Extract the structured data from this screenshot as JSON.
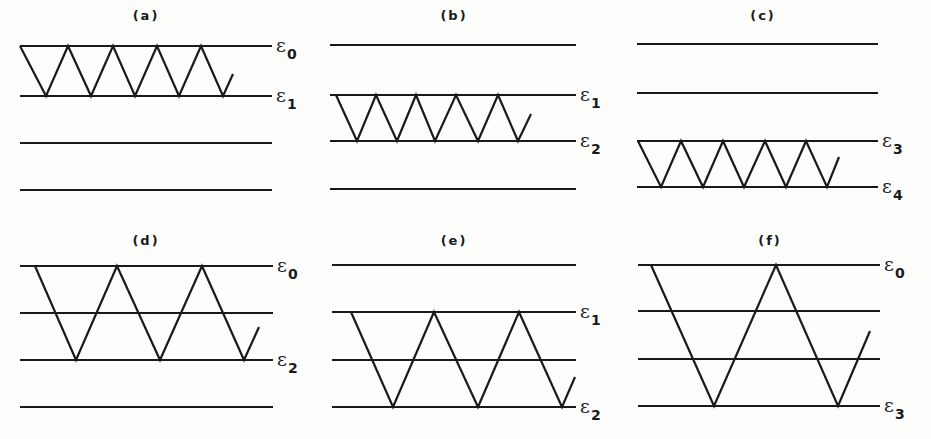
{
  "figure": {
    "stroke_color": "#1a1a1a",
    "background_color": "#fdfdfb",
    "epsilon_symbol": "ε",
    "panels": [
      {
        "id": "a",
        "label": "(a)",
        "label_pos": [
          146,
          16
        ],
        "levels_y": [
          46,
          96,
          143,
          190
        ],
        "levels_x": [
          20,
          272
        ],
        "level_labels": [
          {
            "sub": "0",
            "x": 276,
            "y": 52
          },
          {
            "sub": "1",
            "x": 276,
            "y": 102
          }
        ],
        "zigzag": [
          [
            20,
            46
          ],
          [
            46,
            96
          ],
          [
            68,
            46
          ],
          [
            91,
            96
          ],
          [
            113,
            46
          ],
          [
            135,
            96
          ],
          [
            157,
            46
          ],
          [
            179,
            96
          ],
          [
            201,
            46
          ],
          [
            223,
            96
          ],
          [
            233,
            74
          ]
        ]
      },
      {
        "id": "b",
        "label": "(b)",
        "label_pos": [
          454,
          16
        ],
        "levels_y": [
          45,
          95,
          141,
          189
        ],
        "levels_x": [
          330,
          576
        ],
        "level_labels": [
          {
            "sub": "1",
            "x": 580,
            "y": 101
          },
          {
            "sub": "2",
            "x": 580,
            "y": 147
          }
        ],
        "zigzag": [
          [
            336,
            95
          ],
          [
            357,
            141
          ],
          [
            376,
            95
          ],
          [
            397,
            141
          ],
          [
            416,
            95
          ],
          [
            435,
            141
          ],
          [
            456,
            95
          ],
          [
            478,
            141
          ],
          [
            498,
            95
          ],
          [
            518,
            141
          ],
          [
            531,
            114
          ]
        ]
      },
      {
        "id": "c",
        "label": "(c)",
        "label_pos": [
          763,
          16
        ],
        "levels_y": [
          44,
          93,
          141,
          187
        ],
        "levels_x": [
          637,
          878
        ],
        "level_labels": [
          {
            "sub": "3",
            "x": 882,
            "y": 147
          },
          {
            "sub": "4",
            "x": 882,
            "y": 193
          }
        ],
        "zigzag": [
          [
            638,
            141
          ],
          [
            661,
            187
          ],
          [
            681,
            141
          ],
          [
            703,
            187
          ],
          [
            723,
            141
          ],
          [
            744,
            187
          ],
          [
            765,
            141
          ],
          [
            786,
            187
          ],
          [
            806,
            141
          ],
          [
            827,
            187
          ],
          [
            839,
            157
          ]
        ]
      },
      {
        "id": "d",
        "label": "(d)",
        "label_pos": [
          146,
          241
        ],
        "levels_y": [
          266,
          313,
          360,
          407
        ],
        "levels_x": [
          20,
          273
        ],
        "level_labels": [
          {
            "sub": "0",
            "x": 277,
            "y": 272
          },
          {
            "sub": "2",
            "x": 277,
            "y": 366
          }
        ],
        "zigzag": [
          [
            35,
            266
          ],
          [
            76,
            360
          ],
          [
            117,
            266
          ],
          [
            160,
            360
          ],
          [
            202,
            266
          ],
          [
            244,
            360
          ],
          [
            259,
            327
          ]
        ]
      },
      {
        "id": "e",
        "label": "(e)",
        "label_pos": [
          454,
          241
        ],
        "levels_y": [
          265,
          312,
          360,
          407
        ],
        "levels_x": [
          332,
          576
        ],
        "level_labels": [
          {
            "sub": "1",
            "x": 580,
            "y": 318
          },
          {
            "sub": "2",
            "x": 580,
            "y": 413
          }
        ],
        "zigzag": [
          [
            351,
            312
          ],
          [
            393,
            407
          ],
          [
            434,
            312
          ],
          [
            478,
            407
          ],
          [
            519,
            312
          ],
          [
            562,
            407
          ],
          [
            575,
            377
          ]
        ]
      },
      {
        "id": "f",
        "label": "(f)",
        "label_pos": [
          770,
          241
        ],
        "levels_y": [
          265,
          311,
          359,
          406
        ],
        "levels_x": [
          638,
          880
        ],
        "level_labels": [
          {
            "sub": "0",
            "x": 884,
            "y": 271
          },
          {
            "sub": "3",
            "x": 884,
            "y": 412
          }
        ],
        "zigzag": [
          [
            651,
            265
          ],
          [
            714,
            406
          ],
          [
            776,
            265
          ],
          [
            838,
            406
          ],
          [
            870,
            331
          ]
        ]
      }
    ]
  }
}
